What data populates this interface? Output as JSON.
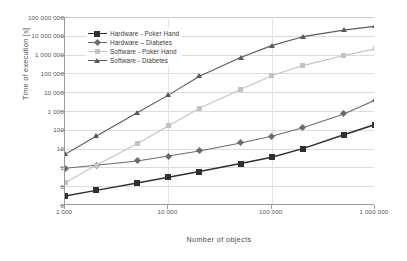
{
  "chart_data": {
    "type": "line",
    "title": "",
    "xlabel": "Number of objects",
    "ylabel": "Time of execution [s]",
    "xscale": "log",
    "yscale": "log",
    "xlim": [
      1000,
      1000000
    ],
    "ylim": [
      0.01,
      100000000
    ],
    "grid": true,
    "legend_position": "upper-left-inside",
    "xtick_labels": [
      "1 000",
      "10 000",
      "100 000",
      "1 000 000"
    ],
    "xtick_values": [
      1000,
      10000,
      100000,
      1000000
    ],
    "ytick_labels": [
      "100 000 000",
      "10 000 000",
      "1 000 000",
      "100 000",
      "10 000",
      "1 000",
      "100",
      "10",
      "1",
      "0",
      "0"
    ],
    "ytick_values": [
      100000000,
      10000000,
      1000000,
      100000,
      10000,
      1000,
      100,
      10,
      1,
      0.1,
      0.01
    ],
    "x": [
      1000,
      2000,
      5000,
      10000,
      20000,
      50000,
      100000,
      200000,
      500000,
      1000000
    ],
    "series": [
      {
        "name": "Hardware - Poker Hand",
        "color": "#2f2f2f",
        "marker": "square",
        "values": [
          0.03,
          0.06,
          0.15,
          0.3,
          0.6,
          1.6,
          3.5,
          10,
          55,
          190
        ]
      },
      {
        "name": "Hardware – Diabetes",
        "color": "#6b6b6b",
        "marker": "diamond",
        "values": [
          0.9,
          1.3,
          2.2,
          4.0,
          7.5,
          20,
          45,
          130,
          700,
          3800
        ]
      },
      {
        "name": "Software - Poker Hand",
        "color": "#c2c2c2",
        "marker": "square-light",
        "values": [
          0.15,
          1.3,
          18,
          160,
          1400,
          14000,
          75000,
          260000,
          900000,
          2000000
        ]
      },
      {
        "name": "Software - Diabetes",
        "color": "#5a5a5a",
        "marker": "triangle",
        "values": [
          5,
          45,
          800,
          7000,
          70000,
          700000,
          3000000,
          9000000,
          20000000,
          32000000
        ]
      }
    ]
  },
  "axis": {
    "x_title": "Number of objects",
    "y_title": "Time of execution [s]"
  },
  "legend": {
    "items": [
      {
        "label": "Hardware - Poker Hand"
      },
      {
        "label": "Hardware – Diabetes"
      },
      {
        "label": "Software - Poker Hand"
      },
      {
        "label": "Software - Diabetes"
      }
    ]
  }
}
